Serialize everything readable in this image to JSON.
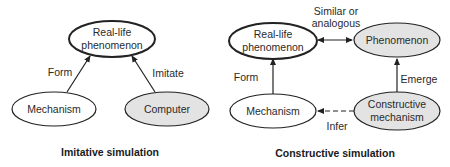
{
  "colors": {
    "stroke": "#222222",
    "gray_fill": "#e3e3e3",
    "white_fill": "#ffffff"
  },
  "left": {
    "caption": "Imitative simulation",
    "nodes": {
      "real_life": {
        "line1": "Real-life",
        "line2": "phenomenon",
        "emphasis": true,
        "fill": "white"
      },
      "mechanism": {
        "label": "Mechanism",
        "fill": "white"
      },
      "computer": {
        "label": "Computer",
        "fill": "gray"
      }
    },
    "edges": {
      "form": {
        "label": "Form",
        "from": "mechanism",
        "to": "real_life",
        "style": "solid"
      },
      "imitate": {
        "label": "Imitate",
        "from": "computer",
        "to": "real_life",
        "style": "solid"
      }
    }
  },
  "right": {
    "caption": "Constructive simulation",
    "nodes": {
      "real_life": {
        "line1": "Real-life",
        "line2": "phenomenon",
        "emphasis": true,
        "fill": "white"
      },
      "phenomenon": {
        "label": "Phenomenon",
        "fill": "gray"
      },
      "mechanism": {
        "label": "Mechanism",
        "fill": "white"
      },
      "constructive": {
        "line1": "Constructive",
        "line2": "mechanism",
        "fill": "gray"
      }
    },
    "edges": {
      "similar": {
        "line1": "Similar or",
        "line2": "analogous",
        "from": "real_life",
        "to": "phenomenon",
        "style": "solid",
        "bidirectional": true
      },
      "form": {
        "label": "Form",
        "from": "mechanism",
        "to": "real_life",
        "style": "solid"
      },
      "emerge": {
        "label": "Emerge",
        "from": "constructive",
        "to": "phenomenon",
        "style": "solid"
      },
      "infer": {
        "label": "Infer",
        "from": "constructive",
        "to": "mechanism",
        "style": "dashed"
      }
    }
  }
}
